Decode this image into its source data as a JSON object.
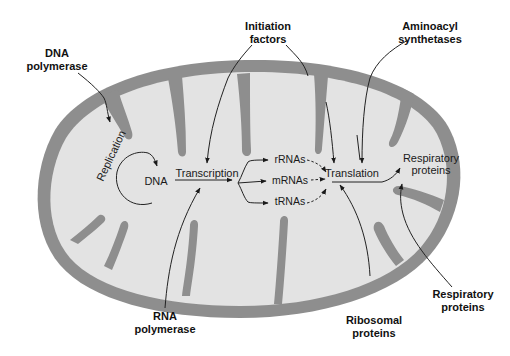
{
  "diagram": {
    "colors": {
      "membrane": "#8e8e8e",
      "matrix": "#e3e3e3",
      "background": "#ffffff",
      "ink": "#1a1a1a"
    },
    "external_labels": {
      "dna_polymerase": [
        "DNA",
        "polymerase"
      ],
      "initiation_factors": [
        "Initiation",
        "factors"
      ],
      "aminoacyl_synthetases": [
        "Aminoacyl",
        "synthetases"
      ],
      "rna_polymerase": [
        "RNA",
        "polymerase"
      ],
      "ribosomal_proteins": [
        "Ribosomal",
        "proteins"
      ],
      "respiratory_proteins_external": [
        "Respiratory",
        "proteins"
      ]
    },
    "internal_labels": {
      "replication": "Replication",
      "dna": "DNA",
      "transcription": "Transcription",
      "rrnas": "rRNAs",
      "mrnas": "mRNAs",
      "trnas": "tRNAs",
      "translation": "Translation",
      "respiratory_proteins_internal": [
        "Respiratory",
        "proteins"
      ]
    },
    "flow": [
      {
        "from": "DNA polymerase",
        "to": "Replication"
      },
      {
        "from": "Replication",
        "to": "DNA"
      },
      {
        "from": "DNA",
        "to": "Transcription"
      },
      {
        "from": "Initiation factors",
        "to": "Transcription"
      },
      {
        "from": "RNA polymerase",
        "to": "Transcription"
      },
      {
        "from": "Transcription",
        "to": "rRNAs"
      },
      {
        "from": "Transcription",
        "to": "mRNAs"
      },
      {
        "from": "Transcription",
        "to": "tRNAs"
      },
      {
        "from": "rRNAs",
        "to": "Translation",
        "style": "dashed"
      },
      {
        "from": "mRNAs",
        "to": "Translation",
        "style": "dashed"
      },
      {
        "from": "tRNAs",
        "to": "Translation",
        "style": "dashed"
      },
      {
        "from": "Initiation factors",
        "to": "Translation"
      },
      {
        "from": "Aminoacyl synthetases",
        "to": "Translation"
      },
      {
        "from": "Ribosomal proteins",
        "to": "Translation"
      },
      {
        "from": "Translation",
        "to": "Respiratory proteins"
      },
      {
        "from": "Respiratory proteins (external)",
        "to": "Respiratory proteins (internal)"
      }
    ]
  }
}
